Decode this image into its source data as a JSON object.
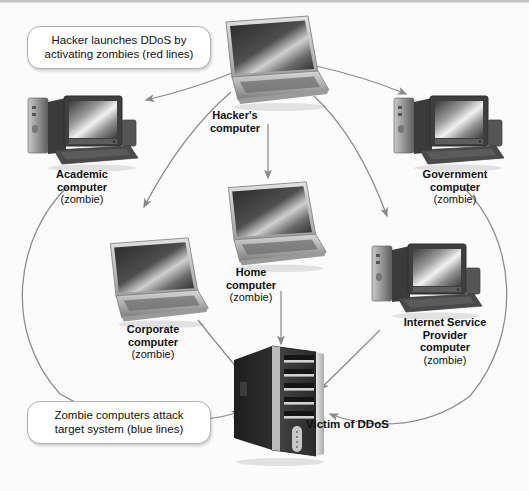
{
  "diagram": {
    "type": "network-attack-diagram",
    "background_color": "#fbfbfb",
    "line_color": "#8a8a8a"
  },
  "callouts": [
    {
      "id": "red-lines",
      "line1": "Hacker launches DDoS by",
      "line2": "activating zombies (red lines)"
    },
    {
      "id": "blue-lines",
      "line1": "Zombie computers attack",
      "line2": "target system (blue lines)"
    }
  ],
  "nodes": {
    "hacker": {
      "name_line1": "Hacker's",
      "name_line2": "computer",
      "role": "",
      "device": "laptop"
    },
    "academic": {
      "name_line1": "Academic",
      "name_line2": "computer",
      "role": "(zombie)",
      "device": "desktop"
    },
    "government": {
      "name_line1": "Government",
      "name_line2": "computer",
      "role": "(zombie)",
      "device": "desktop"
    },
    "home": {
      "name_line1": "Home",
      "name_line2": "computer",
      "role": "(zombie)",
      "device": "laptop"
    },
    "corporate": {
      "name_line1": "Corporate",
      "name_line2": "computer",
      "role": "(zombie)",
      "device": "laptop"
    },
    "isp": {
      "name_line1": "Internet Service",
      "name_line2": "Provider",
      "name_line3": "computer",
      "role": "(zombie)",
      "device": "desktop"
    },
    "victim": {
      "name": "Victim of DDoS",
      "device": "tower"
    }
  }
}
